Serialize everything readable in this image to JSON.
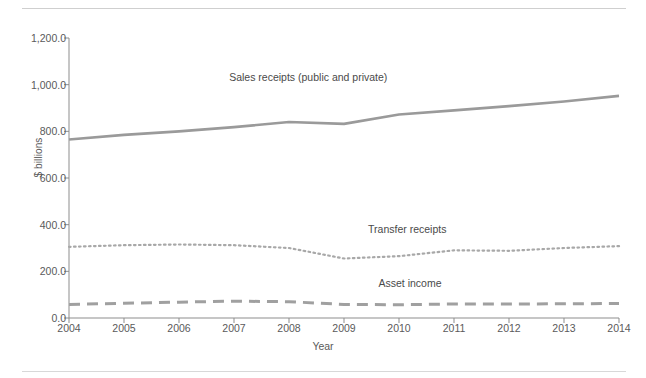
{
  "chart_data": {
    "type": "line",
    "title": "",
    "xlabel": "Year",
    "ylabel": "$ billions",
    "x": [
      2004,
      2005,
      2006,
      2007,
      2008,
      2009,
      2010,
      2011,
      2012,
      2013,
      2014
    ],
    "xtick_labels": [
      "2004",
      "2005",
      "2006",
      "2007",
      "2008",
      "2009",
      "2010",
      "2011",
      "2012",
      "2013",
      "2014"
    ],
    "ytick_labels": [
      "0.0",
      "200.0",
      "400.0",
      "600.0",
      "800.0",
      "1,000.0",
      "1,200.0"
    ],
    "ytick_values": [
      0,
      200,
      400,
      600,
      800,
      1000,
      1200
    ],
    "ylim": [
      0,
      1200
    ],
    "xlim": [
      2004,
      2014
    ],
    "grid": false,
    "legend_position": "inline-annotations",
    "series": [
      {
        "name": "Sales receipts (public and private)",
        "style": "solid",
        "color": "#9a9a9a",
        "values": [
          765,
          785,
          800,
          818,
          840,
          832,
          872,
          890,
          908,
          928,
          952
        ],
        "label_x": 2008.35,
        "label_y": 1030
      },
      {
        "name": "Transfer receipts",
        "style": "dotted",
        "color": "#a8a8a8",
        "values": [
          305,
          312,
          315,
          312,
          300,
          255,
          265,
          290,
          288,
          300,
          308
        ],
        "label_x": 2010.15,
        "label_y": 378
      },
      {
        "name": "Asset income",
        "style": "dashed",
        "color": "#a0a0a0",
        "values": [
          58,
          63,
          68,
          72,
          70,
          58,
          57,
          60,
          60,
          61,
          62
        ],
        "label_x": 2010.2,
        "label_y": 145
      }
    ]
  }
}
